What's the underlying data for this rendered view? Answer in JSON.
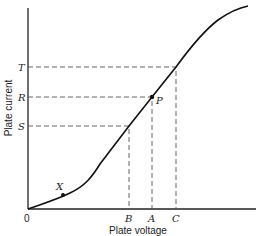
{
  "diagram": {
    "x_axis_label": "Plate voltage",
    "y_axis_label": "Plate current",
    "origin_label": "0",
    "x_markers": [
      {
        "label": "B"
      },
      {
        "label": "A"
      },
      {
        "label": "C"
      }
    ],
    "y_markers": [
      {
        "label": "T"
      },
      {
        "label": "R"
      },
      {
        "label": "S"
      }
    ],
    "points": [
      {
        "label": "P"
      },
      {
        "label": "X"
      }
    ]
  },
  "colors": {
    "line": "#111111",
    "dash": "#555555",
    "background": "#ffffff"
  }
}
